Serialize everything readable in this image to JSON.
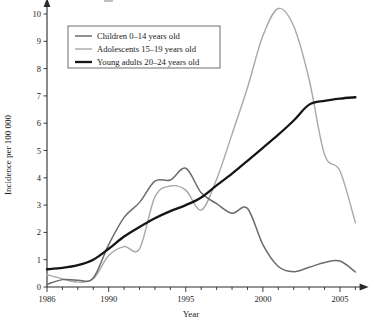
{
  "chart_data": {
    "type": "line",
    "title": "",
    "xlabel": "Year",
    "ylabel": "Incidence per 100 000",
    "xlim": [
      1985.2,
      2006.6
    ],
    "ylim": [
      0,
      10.4
    ],
    "grid": false,
    "legend_position": "top-left",
    "x_ticks": [
      1986,
      1990,
      1995,
      2000,
      2005
    ],
    "x_tick_labels": [
      "1986",
      "1990",
      "1995",
      "2000",
      "2005"
    ],
    "x_minor_ticks": [
      1987,
      1988,
      1989,
      1991,
      1992,
      1993,
      1994,
      1996,
      1997,
      1998,
      1999,
      2001,
      2002,
      2003,
      2004,
      2006
    ],
    "y_ticks": [
      0,
      1,
      2,
      3,
      4,
      5,
      6,
      7,
      8,
      9,
      10
    ],
    "y_tick_labels": [
      "0",
      "1",
      "2",
      "3",
      "4",
      "5",
      "6",
      "7",
      "8",
      "9",
      "10"
    ],
    "x": [
      1986,
      1987,
      1988,
      1989,
      1990,
      1991,
      1992,
      1993,
      1994,
      1995,
      1996,
      1997,
      1998,
      1999,
      2000,
      2001,
      2002,
      2003,
      2004,
      2005,
      2006
    ],
    "series": [
      {
        "name": "Children 0–14 years old",
        "color": "#6b6b6b",
        "width": 1.5,
        "values": [
          0.1,
          0.27,
          0.25,
          0.33,
          1.55,
          2.55,
          3.1,
          3.88,
          3.92,
          4.35,
          3.45,
          3.05,
          2.7,
          2.88,
          1.55,
          0.75,
          0.56,
          0.72,
          0.9,
          0.95,
          0.55
        ]
      },
      {
        "name": "Adolescents 15–19 years old",
        "color": "#a8a8a8",
        "width": 1.4,
        "values": [
          0.45,
          0.3,
          0.18,
          0.3,
          1.15,
          1.48,
          1.4,
          3.3,
          3.7,
          3.55,
          2.82,
          3.95,
          5.6,
          7.3,
          9.2,
          10.2,
          9.55,
          7.6,
          4.85,
          4.25,
          2.35
        ]
      },
      {
        "name": "Young adults 20–24 years old",
        "color": "#161616",
        "width": 2.3,
        "values": [
          0.65,
          0.7,
          0.8,
          1.0,
          1.4,
          1.85,
          2.2,
          2.52,
          2.78,
          3.0,
          3.28,
          3.72,
          4.15,
          4.62,
          5.1,
          5.58,
          6.1,
          6.68,
          6.82,
          6.9,
          6.95
        ]
      }
    ]
  },
  "axes": {
    "x_axis_label": "Year",
    "y_axis_label": "Incidence per 100 000"
  },
  "legend": {
    "entries": [
      {
        "label": "Children 0–14 years old"
      },
      {
        "label": "Adolescents 15–19 years old"
      },
      {
        "label": "Young adults 20–24 years old"
      }
    ]
  }
}
